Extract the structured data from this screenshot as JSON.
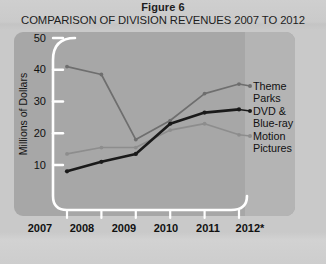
{
  "figure": {
    "label": "Figure 6",
    "title": "COMPARISON OF DIVISION REVENUES 2007 TO 2012"
  },
  "colors": {
    "panel": "#a7a7a7",
    "legend_strip": "#b4b4b4",
    "axis": "#ffffff",
    "theme_parks": "#6e6e6e",
    "dvd_bluray": "#1a1a1a",
    "motion_pictures": "#8d8d8d",
    "text": "#111111"
  },
  "axis": {
    "y_label": "Millions of Dollars",
    "y_ticks": [
      "50",
      "40",
      "30",
      "20",
      "10"
    ],
    "x_ticks": [
      "2007",
      "2008",
      "2009",
      "2010",
      "2011",
      "2012*"
    ]
  },
  "legend": [
    {
      "name": "theme-parks",
      "line1": "Theme",
      "line2": "Parks"
    },
    {
      "name": "dvd-blueray",
      "line1": "DVD &",
      "line2": "Blue-ray"
    },
    {
      "name": "motion-pictures",
      "line1": "Motion",
      "line2": "Pictures"
    }
  ],
  "chart_data": {
    "type": "line",
    "title": "COMPARISON OF DIVISION REVENUES 2007 TO 2012",
    "subtitle": "Figure 6",
    "xlabel": "",
    "ylabel": "Millions of Dollars",
    "categories": [
      "2007",
      "2008",
      "2009",
      "2010",
      "2011",
      "2012*"
    ],
    "ylim": [
      0,
      50
    ],
    "yticks": [
      10,
      20,
      30,
      40,
      50
    ],
    "grid": false,
    "legend_position": "right",
    "series": [
      {
        "name": "Theme Parks",
        "color": "#6e6e6e",
        "values": [
          41,
          38.5,
          18,
          24,
          32.5,
          35.5
        ]
      },
      {
        "name": "DVD & Blue-ray",
        "color": "#1a1a1a",
        "values": [
          8,
          11,
          13.5,
          23,
          26.5,
          27.5
        ]
      },
      {
        "name": "Motion Pictures",
        "color": "#8d8d8d",
        "values": [
          13.5,
          15.5,
          15.5,
          21,
          23,
          19.5
        ]
      }
    ]
  }
}
